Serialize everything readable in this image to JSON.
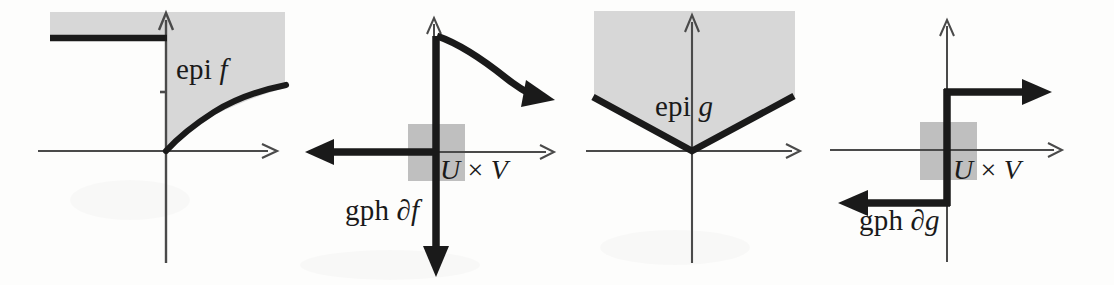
{
  "figure": {
    "background_color": "#fdfdfc",
    "ink_color": "#1a1a1a",
    "shade_color": "#d6d6d6",
    "axis_color": "#4a4a4a",
    "width": 1114,
    "height": 285
  },
  "labels": {
    "epi_f": {
      "prefix": "epi ",
      "symbol": "f"
    },
    "gph_df": {
      "prefix": "gph ",
      "symbol": "∂f"
    },
    "epi_g": {
      "prefix": "epi ",
      "symbol": "g"
    },
    "gph_dg": {
      "prefix": "gph ",
      "symbol": "∂g"
    },
    "u_cross_v_1": {
      "u": "U",
      "times": " × ",
      "v": "V"
    },
    "u_cross_v_2": {
      "u": "U",
      "times": " × ",
      "v": "V"
    }
  },
  "panels": [
    {
      "id": "panel-epi-f",
      "name": "epigraph-of-f",
      "caption": "epi f",
      "description": "Shaded epigraph of a convex function f that is +infinity for x<0, equals sqrt-like increasing curve for x>=0",
      "origin": {
        "x": 166,
        "y": 151
      },
      "axes": {
        "x_axis": {
          "from_x": 38,
          "to_x": 275,
          "y": 151,
          "arrow": "right"
        },
        "y_axis": {
          "x": 166,
          "from_y": 263,
          "to_y": 13,
          "arrow": "up"
        },
        "tick": {
          "x": 166,
          "y": 93
        }
      },
      "shaded_region": {
        "left": 50,
        "top": 12,
        "right": 285,
        "bottom_at_right": 88
      },
      "graph": {
        "type": "half-line-plus-curve",
        "flat_segment": {
          "from_x": 50,
          "to_x": 166,
          "y": 38
        },
        "curve": "sqrt from origin (166,151) rising to (285,88)"
      }
    },
    {
      "id": "panel-gph-df",
      "name": "graph-of-subdifferential-f",
      "caption": "gph ∂f",
      "description": "Graph of the subdifferential of f: vertical ray down the y-axis and a decreasing convex curve to the right",
      "origin": {
        "x": 434,
        "y": 152
      },
      "axes": {
        "x_axis": {
          "from_x": 318,
          "to_x": 552,
          "y": 152,
          "arrow": "right"
        },
        "y_axis": {
          "x": 434,
          "from_y": 264,
          "to_y": 18,
          "arrow": "up"
        }
      },
      "neighborhood_box": {
        "left": 408,
        "top": 124,
        "right": 465,
        "bottom": 181
      },
      "graph": {
        "type": "vertical-ray-plus-decreasing-curve",
        "vertical_ray": {
          "x": 436,
          "from_y": 36,
          "to_y": 270,
          "arrow": "down"
        },
        "horizontal_ray": {
          "y": 152,
          "from_x": 434,
          "to_x": 312,
          "arrow": "left"
        },
        "curve": "from (437,36) decaying right to arrow at (548,98)"
      }
    },
    {
      "id": "panel-epi-g",
      "name": "epigraph-of-g",
      "caption": "epi g",
      "description": "Shaded epigraph of g(x) = c|x|, a V-shaped absolute-value function",
      "origin": {
        "x": 692,
        "y": 151
      },
      "axes": {
        "x_axis": {
          "from_x": 586,
          "to_x": 800,
          "y": 151,
          "arrow": "right"
        },
        "y_axis": {
          "x": 692,
          "from_y": 263,
          "to_y": 15,
          "arrow": "up"
        }
      },
      "shaded_region": {
        "left": 594,
        "top": 11,
        "right": 795,
        "v_arm_top_y": 98
      },
      "graph": {
        "type": "absolute-value-V",
        "vertex": {
          "x": 692,
          "y": 151
        },
        "left_end": {
          "x": 594,
          "y": 98
        },
        "right_end": {
          "x": 795,
          "y": 98
        }
      }
    },
    {
      "id": "panel-gph-dg",
      "name": "graph-of-subdifferential-g",
      "caption": "gph ∂g",
      "description": "Graph of the subdifferential of g: a step / monotone staircase relation through the origin",
      "origin": {
        "x": 947,
        "y": 150
      },
      "axes": {
        "x_axis": {
          "from_x": 830,
          "to_x": 1062,
          "y": 150,
          "arrow": "right"
        },
        "y_axis": {
          "x": 947,
          "from_y": 262,
          "to_y": 20,
          "arrow": "up"
        }
      },
      "neighborhood_box": {
        "left": 920,
        "top": 122,
        "right": 977,
        "bottom": 180
      },
      "graph": {
        "type": "step",
        "vertical_segment": {
          "x": 947,
          "from_y": 92,
          "to_y": 203
        },
        "upper_ray": {
          "y": 92,
          "from_x": 947,
          "to_x": 1052,
          "arrow": "right"
        },
        "lower_ray": {
          "y": 203,
          "from_x": 947,
          "to_x": 838,
          "arrow": "left"
        }
      }
    }
  ]
}
